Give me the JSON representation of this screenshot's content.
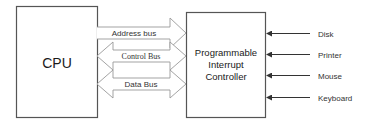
{
  "diagram": {
    "colors": {
      "box_stroke": "#555555",
      "arrow_stroke": "#999999",
      "device_arrow": "#333333",
      "text": "#1a1a1a"
    },
    "nodes": {
      "cpu": {
        "label": "CPU"
      },
      "pic": {
        "label_lines": [
          "Programmable",
          "Interrupt",
          "Controller"
        ]
      }
    },
    "buses": [
      {
        "label": "Address bus",
        "direction": "cpu-to-pic"
      },
      {
        "label": "Control Bus",
        "direction": "bidirectional"
      },
      {
        "label": "Data Bus",
        "direction": "bidirectional"
      }
    ],
    "devices": [
      {
        "label": "Disk"
      },
      {
        "label": "Printer"
      },
      {
        "label": "Mouse"
      },
      {
        "label": "Keyboard"
      }
    ]
  }
}
